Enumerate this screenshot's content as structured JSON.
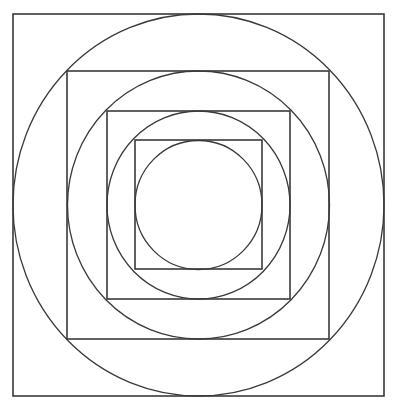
{
  "diagram": {
    "stroke_color": "#3a3a3a",
    "background": "#ffffff",
    "center": {
      "x": 198.5,
      "y": 205
    },
    "layers": [
      {
        "type": "square",
        "x1": 13,
        "y1": 14,
        "x2": 384,
        "y2": 396
      },
      {
        "type": "circle",
        "rx": 185.5,
        "ry": 191
      },
      {
        "type": "square",
        "x1": 67,
        "y1": 71,
        "x2": 329,
        "y2": 339
      },
      {
        "type": "circle",
        "rx": 131,
        "ry": 134
      },
      {
        "type": "square",
        "x1": 107,
        "y1": 111,
        "x2": 290,
        "y2": 299
      },
      {
        "type": "circle",
        "rx": 91.5,
        "ry": 94
      },
      {
        "type": "square",
        "x1": 135,
        "y1": 140,
        "x2": 262,
        "y2": 269
      },
      {
        "type": "circle",
        "rx": 63.5,
        "ry": 64.5
      }
    ]
  }
}
